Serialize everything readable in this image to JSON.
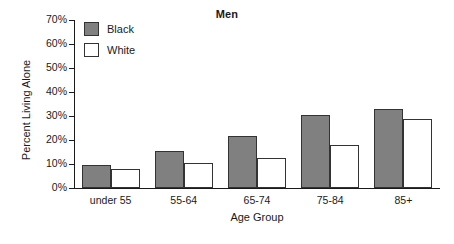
{
  "chart_data": {
    "type": "bar",
    "title": "Men",
    "xlabel": "Age Group",
    "ylabel": "Percent Living Alone",
    "categories": [
      "under 55",
      "55-64",
      "65-74",
      "75-84",
      "85+"
    ],
    "series": [
      {
        "name": "Black",
        "color": "#808080",
        "values": [
          9.5,
          15.5,
          21.5,
          30.5,
          33.0
        ]
      },
      {
        "name": "White",
        "color": "#ffffff",
        "values": [
          8.0,
          10.5,
          12.3,
          18.0,
          28.8
        ]
      }
    ],
    "ylim": [
      0,
      70
    ],
    "ytick_labels": [
      "0%",
      "10%",
      "20%",
      "30%",
      "40%",
      "50%",
      "60%",
      "70%"
    ],
    "ytick_values": [
      0,
      10,
      20,
      30,
      40,
      50,
      60,
      70
    ],
    "grid": false,
    "legend_position": "top-left"
  }
}
